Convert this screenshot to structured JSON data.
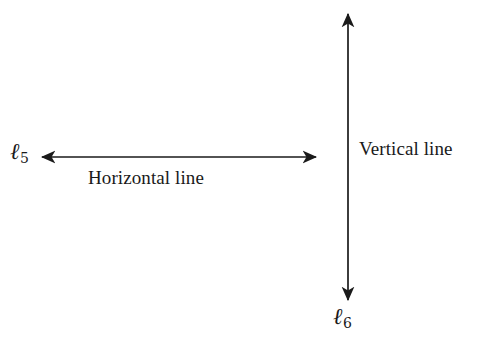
{
  "figure": {
    "background_color": "#ffffff",
    "stroke_color": "#1a1a1a",
    "labels": {
      "horizontal_caption": "Horizontal line",
      "vertical_caption": "Vertical line",
      "horizontal_line_name": "ℓ",
      "horizontal_line_subscript": "5",
      "vertical_line_name": "ℓ",
      "vertical_line_subscript": "6"
    },
    "geometry": {
      "horizontal_arrow": {
        "x1": 42,
        "y1": 157,
        "x2": 316,
        "y2": 157,
        "double_headed": true
      },
      "vertical_arrow": {
        "x1": 348,
        "y1": 14,
        "x2": 348,
        "y2": 300,
        "double_headed": true
      }
    }
  },
  "chart_data": {
    "type": "diagram",
    "title": "",
    "elements": [
      {
        "name": "horizontal-line",
        "label": "ℓ5",
        "caption": "Horizontal line",
        "orientation": "horizontal",
        "arrowheads": "both",
        "start": [
          42,
          157
        ],
        "end": [
          316,
          157
        ],
        "length_px": 274
      },
      {
        "name": "vertical-line",
        "label": "ℓ6",
        "caption": "Vertical line",
        "orientation": "vertical",
        "arrowheads": "both",
        "start": [
          348,
          14
        ],
        "end": [
          348,
          300
        ],
        "length_px": 286
      }
    ],
    "relationship": "perpendicular",
    "grid": false,
    "legend": "none"
  }
}
